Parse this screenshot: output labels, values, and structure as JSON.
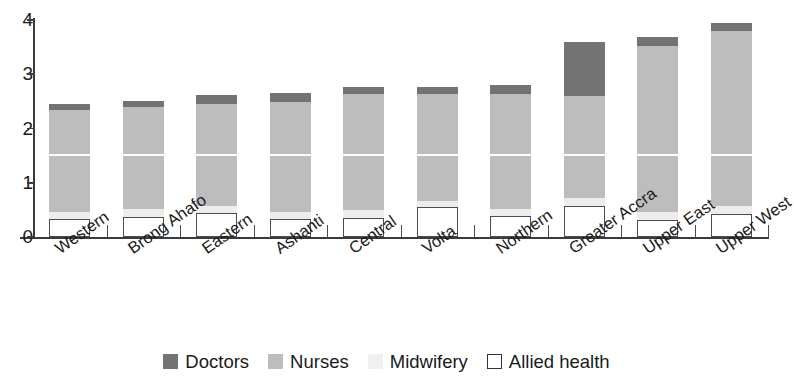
{
  "chart_data": {
    "type": "bar",
    "stacked": true,
    "title": "",
    "subtitle": "",
    "xlabel": "",
    "ylabel": "",
    "ylim": [
      0,
      4
    ],
    "yticks": [
      0,
      1,
      2,
      3,
      4
    ],
    "ytick_labels": [
      "0",
      "1",
      "2",
      "3",
      "4"
    ],
    "grid": false,
    "legend_position": "bottom",
    "categories": [
      "Western",
      "Brong Ahafo",
      "Eastern",
      "Ashanti",
      "Central",
      "Volta",
      "Northern",
      "Greater Accra",
      "Upper East",
      "Upper West"
    ],
    "series": [
      {
        "name": "Allied health",
        "color": "#ffffff",
        "values": [
          0.33,
          0.37,
          0.45,
          0.33,
          0.35,
          0.55,
          0.38,
          0.57,
          0.32,
          0.43
        ]
      },
      {
        "name": "Midwifery",
        "color": "#ededed",
        "values": [
          0.13,
          0.14,
          0.13,
          0.14,
          0.15,
          0.12,
          0.14,
          0.14,
          0.15,
          0.15
        ]
      },
      {
        "name": "Nurses",
        "color": "#bdbdbd",
        "values": [
          1.89,
          1.88,
          1.88,
          2.02,
          2.13,
          1.96,
          2.12,
          1.89,
          3.05,
          3.21
        ]
      },
      {
        "name": "Doctors",
        "color": "#737373",
        "values": [
          0.11,
          0.11,
          0.15,
          0.17,
          0.14,
          0.13,
          0.16,
          1.0,
          0.16,
          0.15
        ]
      }
    ],
    "totals": [
      2.46,
      2.5,
      2.61,
      2.66,
      2.77,
      2.76,
      2.8,
      3.6,
      3.68,
      3.94
    ],
    "separator_line_value": 1.5
  },
  "legend": {
    "items": [
      {
        "label": "Doctors",
        "swatch": "doctors-swatch"
      },
      {
        "label": "Nurses",
        "swatch": "nurses-swatch"
      },
      {
        "label": "Midwifery",
        "swatch": "midwifery-swatch"
      },
      {
        "label": "Allied health",
        "swatch": "allied-health-swatch"
      }
    ]
  },
  "colors": {
    "doctors": "#737373",
    "nurses": "#bdbdbd",
    "midwifery": "#ededed",
    "allied_health": "#ffffff",
    "axis": "#3b3b3b",
    "text": "#1a1a1a",
    "background": "#ffffff"
  }
}
